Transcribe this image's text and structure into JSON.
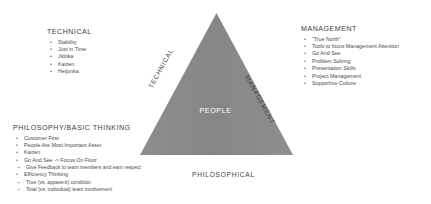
{
  "diagram": {
    "triangle": {
      "fill_color": "#8a8a8a",
      "center_label": "PEOPLE",
      "center_label_color": "#ffffff",
      "edge_labels": {
        "left": "TECHNICAL",
        "right": "MANAGEMENT",
        "bottom": "PHILOSOPHICAL"
      }
    },
    "blocks": [
      {
        "id": "technical",
        "heading": "TECHNICAL",
        "bullet_glyph": "•",
        "items": [
          {
            "text": "Stability"
          },
          {
            "text": "Just in Time"
          },
          {
            "text": "Jidoka"
          },
          {
            "text": "Kaizen"
          },
          {
            "text": "Heijunka"
          }
        ]
      },
      {
        "id": "management",
        "heading": "MANAGEMENT",
        "bullet_glyph": "•",
        "items": [
          {
            "text": "“True North”"
          },
          {
            "text": "Tools to focus Management Attention"
          },
          {
            "text": "Go And See"
          },
          {
            "text": "Problem Solving"
          },
          {
            "text": "Presentation Skills"
          },
          {
            "text": "Project Management"
          },
          {
            "text": "Supportive Culture"
          }
        ]
      },
      {
        "id": "philosophy",
        "heading": "PHILOSOPHY/BASIC THINKING",
        "bullet_glyph": "•",
        "sub_bullet_glyph": "▪",
        "items": [
          {
            "text": "Customer First",
            "children": []
          },
          {
            "text": "People Are Most Important Asset",
            "children": []
          },
          {
            "text": "Kaizen",
            "children": []
          },
          {
            "text": "Go And See -> Focus On Floor",
            "children": [
              {
                "text": "Give Feedback to team members and earn respect"
              }
            ]
          },
          {
            "text": "Efficiency Thinking",
            "children": [
              {
                "text": "True (vs. apparent) condition"
              },
              {
                "text": "Total (vs. individual) team involvement"
              }
            ]
          }
        ]
      }
    ]
  }
}
